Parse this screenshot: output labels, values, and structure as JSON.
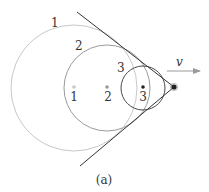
{
  "figure": {
    "caption": "(a)",
    "velocity_label": "v",
    "colors": {
      "wave1": "#c8c8c8",
      "wave2": "#9a9a9a",
      "wave3": "#4a4a4a",
      "source": "#222222",
      "cone": "#333333",
      "arrow": "#9a9a9a",
      "text": "#333333"
    },
    "wavefronts": [
      {
        "id": "1",
        "label": "1",
        "center_label": "1",
        "cx": 74,
        "cy": 88,
        "r": 63
      },
      {
        "id": "2",
        "label": "2",
        "center_label": "2",
        "cx": 107,
        "cy": 88,
        "r": 43
      },
      {
        "id": "3",
        "label": "3",
        "center_label": "3",
        "cx": 143,
        "cy": 88,
        "r": 22
      }
    ],
    "source": {
      "cx": 174,
      "cy": 87
    },
    "mach_cone": {
      "upper": {
        "x1": 77,
        "y1": 12,
        "x2": 174,
        "y2": 87
      },
      "lower": {
        "x1": 80,
        "y1": 166,
        "x2": 174,
        "y2": 87
      }
    }
  }
}
